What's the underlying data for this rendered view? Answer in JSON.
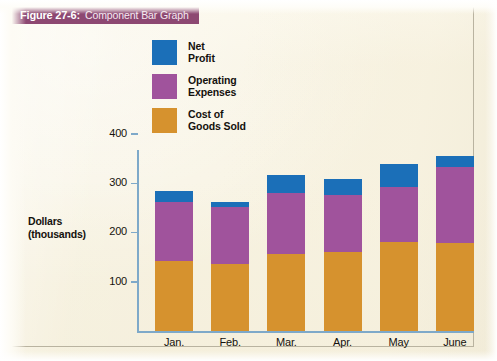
{
  "figure": {
    "number": "Figure 27-6:",
    "caption": "Component Bar Graph",
    "banner_color": "#8d4872"
  },
  "chart_data": {
    "type": "bar",
    "stacked": true,
    "title": "Component Bar Graph",
    "xlabel": "",
    "ylabel": "Dollars (thousands)",
    "ylabel_lines": [
      "Dollars",
      "(thousands)"
    ],
    "categories": [
      "Jan.",
      "Feb.",
      "Mar.",
      "Apr.",
      "May",
      "June"
    ],
    "series": [
      {
        "name": "Cost of Goods Sold",
        "legend_lines": [
          "Cost of",
          "Goods Sold"
        ],
        "color": "#d6922e",
        "values": [
          142,
          136,
          156,
          160,
          180,
          179
        ]
      },
      {
        "name": "Operating Expenses",
        "legend_lines": [
          "Operating",
          "Expenses"
        ],
        "color": "#a0539c",
        "values": [
          120,
          115,
          124,
          116,
          112,
          154
        ]
      },
      {
        "name": "Net Profit",
        "legend_lines": [
          "Net",
          "Profit"
        ],
        "color": "#1b6fb8",
        "values": [
          22,
          10,
          37,
          33,
          47,
          22
        ]
      }
    ],
    "totals": [
      284,
      261,
      317,
      309,
      339,
      355
    ],
    "yticks": [
      100,
      200,
      300,
      400
    ],
    "ytick_labels": [
      "100",
      "200",
      "300",
      "400"
    ],
    "ylim": [
      0,
      420
    ],
    "grid": false,
    "legend_position": "upper-left-inside",
    "axis_color": "#7ea9c9"
  }
}
